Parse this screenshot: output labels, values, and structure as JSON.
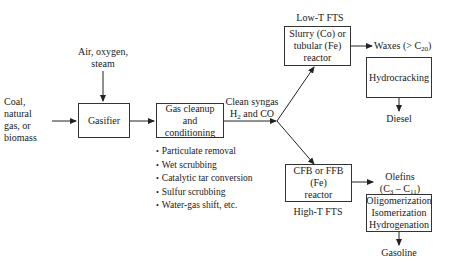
{
  "diagram": {
    "type": "process-flow",
    "title": "",
    "feedstock": {
      "lines": [
        "Coal,",
        "natural",
        "gas, or",
        "biomass"
      ]
    },
    "oxidant": {
      "lines": [
        "Air, oxygen,",
        "steam"
      ]
    },
    "gasifier": {
      "label": "Gasifier"
    },
    "cleanup": {
      "lines": [
        "Gas cleanup",
        "and conditioning"
      ],
      "steps": [
        "Particulate removal",
        "Wet scrubbing",
        "Catalytic tar conversion",
        "Sulfur scrubbing",
        "Water-gas shift, etc."
      ]
    },
    "syngas": {
      "line1": "Clean syngas",
      "line2_prefix": "H",
      "line2_sub": "2",
      "line2_suffix": " and CO"
    },
    "low_t": {
      "header": "Low-T FTS",
      "reactor_lines": [
        "Slurry (Co) or",
        "tubular (Fe)",
        "reactor"
      ],
      "product_prefix": "Waxes (> C",
      "product_sub": "20",
      "product_suffix": ")",
      "upgrading": "Hydrocracking",
      "final": "Diesel"
    },
    "high_t": {
      "footer": "High-T FTS",
      "reactor_lines": [
        "CFB or FFB (Fe)",
        "reactor"
      ],
      "product_line1": "Olefins",
      "product_c1": "3",
      "product_c2": "11",
      "upgrading_lines": [
        "Oligomerization",
        "Isomerization",
        "Hydrogenation"
      ],
      "final": "Gasoline"
    }
  }
}
